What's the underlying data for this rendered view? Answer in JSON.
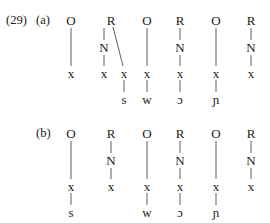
{
  "example_number": "(29)",
  "panels": [
    {
      "label": "(a)",
      "columns": [
        {
          "type": "O",
          "segment": ""
        },
        {
          "type": "R",
          "nucleus": "N",
          "branching": true,
          "segment": "s"
        },
        {
          "type": "O",
          "segment": "w"
        },
        {
          "type": "R",
          "nucleus": "N",
          "segment": "ɔ"
        },
        {
          "type": "O",
          "segment": "ɲ"
        },
        {
          "type": "R",
          "nucleus": "N",
          "segment": ""
        }
      ]
    },
    {
      "label": "(b)",
      "columns": [
        {
          "type": "O",
          "segment": "s"
        },
        {
          "type": "R",
          "nucleus": "N",
          "segment": ""
        },
        {
          "type": "O",
          "segment": "w"
        },
        {
          "type": "R",
          "nucleus": "N",
          "segment": "ɔ"
        },
        {
          "type": "O",
          "segment": "ɲ"
        },
        {
          "type": "R",
          "nucleus": "N",
          "segment": ""
        }
      ]
    }
  ],
  "skeletal_slot": "x"
}
